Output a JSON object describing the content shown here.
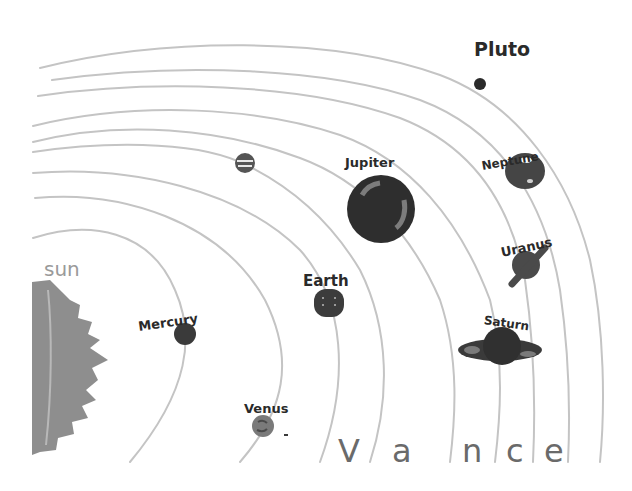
{
  "drawing": {
    "title": "Solar System drawing",
    "medium": "marker on paper, grayscale scan",
    "background": "#ffffff",
    "orbit_color": "#c4c4c4",
    "ink_color": "#2a2a2a"
  },
  "sun": {
    "label": "sun",
    "color": "#8e8e8e"
  },
  "planets": [
    {
      "name": "Mercury",
      "label": "Mercury",
      "color": "#3a3a3a"
    },
    {
      "name": "Venus",
      "label": "Venus",
      "color": "#7a7a7a"
    },
    {
      "name": "Earth",
      "label": "Earth",
      "color": "#3c3c3c"
    },
    {
      "name": "Mars",
      "label": "",
      "color": "#555555"
    },
    {
      "name": "Jupiter",
      "label": "Jupiter",
      "color": "#2e2e2e"
    },
    {
      "name": "Saturn",
      "label": "Saturn",
      "color": "#303030"
    },
    {
      "name": "Uranus",
      "label": "Uranus",
      "color": "#4a4a4a"
    },
    {
      "name": "Neptune",
      "label": "Neptune",
      "color": "#454545"
    },
    {
      "name": "Pluto",
      "label": "Pluto",
      "color": "#2a2a2a"
    }
  ],
  "signature": {
    "letters": [
      "V",
      "a",
      "n",
      "c",
      "e"
    ],
    "text": "Vance"
  }
}
